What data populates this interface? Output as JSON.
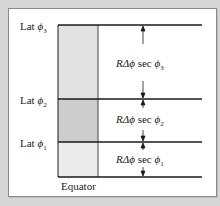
{
  "diagram": {
    "type": "latitude-spacing-figure",
    "latitude_labels": [
      {
        "text": "Lat",
        "symbol": "ϕ",
        "subscript": "3"
      },
      {
        "text": "Lat",
        "symbol": "ϕ",
        "subscript": "2"
      },
      {
        "text": "Lat",
        "symbol": "ϕ",
        "subscript": "1"
      }
    ],
    "spacing_labels": [
      {
        "prefix": "R",
        "delta": "Δϕ",
        "sec": "sec",
        "symbol": "ϕ",
        "subscript": "3"
      },
      {
        "prefix": "R",
        "delta": "Δϕ",
        "sec": "sec",
        "symbol": "ϕ",
        "subscript": "2"
      },
      {
        "prefix": "R",
        "delta": "Δϕ",
        "sec": "sec",
        "symbol": "ϕ",
        "subscript": "1"
      }
    ],
    "baseline_label": "Equator",
    "colors": {
      "background": "#d6d6d6",
      "panel": "#ffffff",
      "cell_top": "#e2e2e2",
      "cell_middle": "#cdcdcd",
      "cell_bottom": "#ebebeb",
      "line": "#1a1a1a"
    }
  }
}
